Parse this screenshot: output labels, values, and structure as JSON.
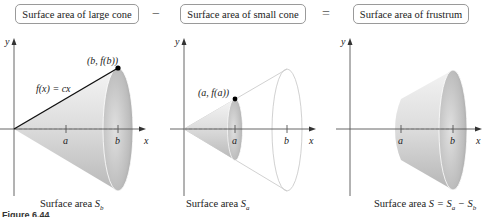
{
  "equation": {
    "term1": "Surface area of large cone",
    "minus": "−",
    "term2": "Surface area of small cone",
    "equals": "=",
    "result": "Surface area of frustrum"
  },
  "panels": [
    {
      "id": "large-cone",
      "axis_y": "y",
      "axis_x": "x",
      "tick_a": "a",
      "tick_b": "b",
      "point_label": "(b, f(b))",
      "function_label": "f(x) = cx",
      "caption_text": "Surface area ",
      "caption_sym": "S",
      "caption_sub": "b"
    },
    {
      "id": "small-cone",
      "axis_y": "y",
      "axis_x": "x",
      "tick_a": "a",
      "tick_b": "b",
      "point_label": "(a, f(a))",
      "caption_text": "Surface area ",
      "caption_sym": "S",
      "caption_sub": "a"
    },
    {
      "id": "frustum",
      "axis_y": "y",
      "axis_x": "x",
      "tick_a": "a",
      "tick_b": "b",
      "caption_text": "Surface area ",
      "caption_formula": "S = S",
      "caption_sub1": "a",
      "caption_minus": " − S",
      "caption_sub2": "b"
    }
  ],
  "figure_label": "Figure 6.44",
  "colors": {
    "cone_light": "#ececec",
    "cone_mid": "#cfcfcf",
    "cone_dark": "#a9a9a9",
    "axis": "#555555",
    "outline": "#c8c8c8"
  }
}
